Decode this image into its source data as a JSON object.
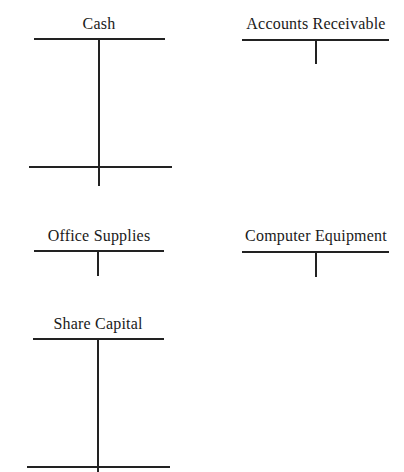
{
  "accounts": [
    {
      "name": "Cash"
    },
    {
      "name": "Accounts Receivable"
    },
    {
      "name": "Office Supplies"
    },
    {
      "name": "Computer Equipment"
    },
    {
      "name": "Share Capital"
    }
  ]
}
